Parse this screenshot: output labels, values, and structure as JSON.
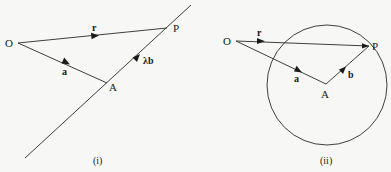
{
  "figure_i": {
    "caption": "(i)",
    "points": {
      "O": {
        "label": "O",
        "x": 18,
        "y": 43
      },
      "A": {
        "label": "A",
        "x": 107,
        "y": 83
      },
      "P": {
        "label": "P",
        "x": 167,
        "y": 28
      }
    },
    "line": {
      "from": [
        25,
        158
      ],
      "to": [
        191,
        5
      ]
    },
    "vectors": {
      "r": {
        "label": "r"
      },
      "a": {
        "label": "a"
      },
      "lambda_b": {
        "label": "λb"
      }
    }
  },
  "figure_ii": {
    "caption": "(ii)",
    "points": {
      "O": {
        "label": "O",
        "x": 236,
        "y": 41
      },
      "A": {
        "label": "A",
        "x": 326,
        "y": 84
      },
      "P": {
        "label": "P",
        "x": 369,
        "y": 46
      }
    },
    "circle": {
      "cx": 327,
      "cy": 85,
      "r": 60
    },
    "vectors": {
      "r": {
        "label": "r"
      },
      "a": {
        "label": "a"
      },
      "b": {
        "label": "b"
      }
    }
  },
  "colors": {
    "background": "#f7f7f5",
    "ink": "#1a1a1a"
  }
}
